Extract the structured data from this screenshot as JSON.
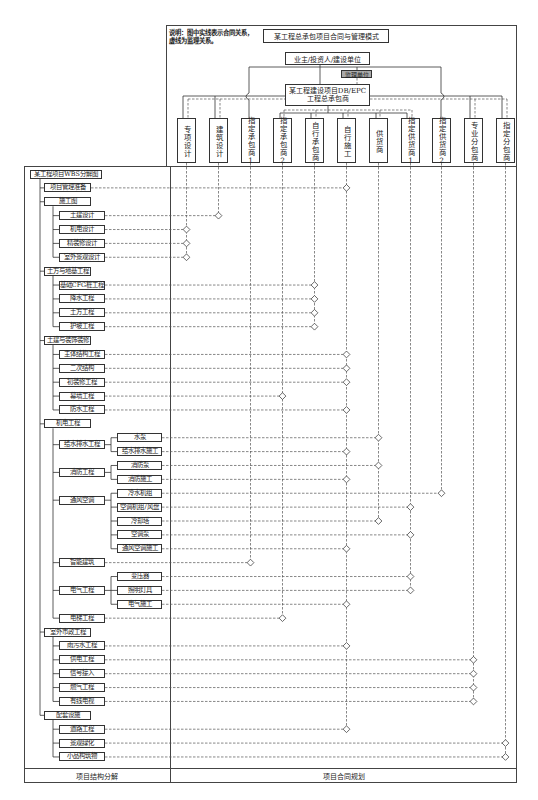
{
  "header": {
    "note_line1": "说明：图中实线表示合同关系，",
    "note_line2": "虚线为监理关系。",
    "title": "某工程总承包项目合同与管理模式",
    "owner": "业主/投资人/建设单位",
    "supervisor": "监理单位",
    "contractor_line1": "某工程建设项目DB/EPC",
    "contractor_line2": "工程总承包商"
  },
  "columns": [
    {
      "label": "专项设计"
    },
    {
      "label": "建筑设计"
    },
    {
      "label": "指定承包商1"
    },
    {
      "label": "指定承包商2"
    },
    {
      "label": "自行承包商"
    },
    {
      "label": "自行施工"
    },
    {
      "label": "供货商"
    },
    {
      "label": "指定供货商1"
    },
    {
      "label": "指定供货商2"
    },
    {
      "label": "专业分包商"
    },
    {
      "label": "指定分包商"
    }
  ],
  "wbs": {
    "root": "某工程项目WBS分解图",
    "groups": [
      {
        "label": "项目管理准备",
        "assigned_to": "自行施工"
      },
      {
        "label": "施工图",
        "children": [
          {
            "label": "土建设计",
            "assigned_to": "建筑设计"
          },
          {
            "label": "机电设计",
            "assigned_to": "专项设计"
          },
          {
            "label": "精装修设计",
            "assigned_to": "专项设计"
          },
          {
            "label": "室外景观设计",
            "assigned_to": "专项设计"
          }
        ]
      },
      {
        "label": "土方与地基工程",
        "children": [
          {
            "label": "基础CFG桩工程",
            "assigned_to": "自行承包商"
          },
          {
            "label": "降水工程",
            "assigned_to": "自行承包商"
          },
          {
            "label": "土方工程",
            "assigned_to": "自行承包商"
          },
          {
            "label": "护坡工程",
            "assigned_to": "自行承包商"
          }
        ]
      },
      {
        "label": "土建与装饰装修",
        "children": [
          {
            "label": "主体结构工程",
            "assigned_to": "自行施工"
          },
          {
            "label": "二次结构",
            "assigned_to": "自行施工"
          },
          {
            "label": "初装修工程",
            "assigned_to": "自行施工"
          },
          {
            "label": "幕墙工程",
            "assigned_to": "指定承包商2"
          },
          {
            "label": "防水工程",
            "assigned_to": "自行施工"
          }
        ]
      },
      {
        "label": "机电工程",
        "children": [
          {
            "label": "给水排水工程",
            "children": [
              {
                "label": "水泵",
                "assigned_to": "供货商"
              },
              {
                "label": "给水排水施工",
                "assigned_to": "自行施工"
              }
            ]
          },
          {
            "label": "消防工程",
            "children": [
              {
                "label": "消防泵",
                "assigned_to": "供货商"
              },
              {
                "label": "消防施工",
                "assigned_to": "自行施工"
              }
            ]
          },
          {
            "label": "通风空调",
            "children": [
              {
                "label": "冷水机组",
                "assigned_to": "指定供货商2"
              },
              {
                "label": "空调机组/风盘",
                "assigned_to": "指定供货商1"
              },
              {
                "label": "冷却塔",
                "assigned_to": "供货商"
              },
              {
                "label": "空调泵",
                "assigned_to": "指定供货商1"
              },
              {
                "label": "通风空调施工",
                "assigned_to": "自行施工"
              }
            ]
          },
          {
            "label": "智能建筑",
            "assigned_to": "指定承包商1"
          },
          {
            "label": "电气工程",
            "children": [
              {
                "label": "变压器",
                "assigned_to": "指定供货商1"
              },
              {
                "label": "照明灯具",
                "assigned_to": "指定供货商1"
              },
              {
                "label": "电气施工",
                "assigned_to": "自行施工"
              }
            ]
          },
          {
            "label": "电梯工程",
            "assigned_to": "指定承包商2"
          }
        ]
      },
      {
        "label": "室外市政工程",
        "children": [
          {
            "label": "雨污水工程",
            "assigned_to": "自行施工"
          },
          {
            "label": "供电工程",
            "assigned_to": "专业分包商"
          },
          {
            "label": "信号接入",
            "assigned_to": "专业分包商"
          },
          {
            "label": "燃气工程",
            "assigned_to": "专业分包商"
          },
          {
            "label": "有线电视",
            "assigned_to": "专业分包商"
          }
        ]
      },
      {
        "label": "配套设施",
        "children": [
          {
            "label": "道路工程",
            "assigned_to": "自行施工"
          },
          {
            "label": "景观绿化",
            "assigned_to": "指定分包商"
          },
          {
            "label": "小品构筑物",
            "assigned_to": "指定分包商"
          }
        ]
      }
    ]
  },
  "footer": {
    "left": "项目结构分解",
    "right": "项目合同规划"
  },
  "line_styles": {
    "solid": "合同关系",
    "dashed": "监理关系"
  }
}
